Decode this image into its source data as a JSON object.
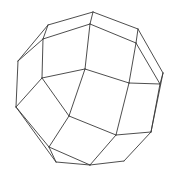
{
  "figure": {
    "type": "wireframe-polyhedron",
    "background": "#ffffff",
    "stroke_color": "#3a3a3a",
    "vertices": {
      "A": [
        48,
        25
      ],
      "B": [
        93,
        12
      ],
      "C": [
        138,
        29
      ],
      "D": [
        43,
        39
      ],
      "E": [
        90,
        24
      ],
      "F": [
        136,
        43
      ],
      "G": [
        18,
        61
      ],
      "H": [
        163,
        73
      ],
      "I": [
        160,
        84
      ],
      "J": [
        42,
        78
      ],
      "K": [
        85,
        69
      ],
      "L": [
        129,
        83
      ],
      "M": [
        16,
        107
      ],
      "N": [
        69,
        116
      ],
      "O": [
        116,
        135
      ],
      "P": [
        151,
        132
      ],
      "Q": [
        49,
        147
      ],
      "R": [
        56,
        162
      ],
      "S": [
        90,
        165
      ],
      "T": [
        124,
        161
      ]
    },
    "edges": [
      [
        "A",
        "B"
      ],
      [
        "B",
        "C"
      ],
      [
        "D",
        "E"
      ],
      [
        "E",
        "F"
      ],
      [
        "B",
        "E"
      ],
      [
        "A",
        "D"
      ],
      [
        "C",
        "F"
      ],
      [
        "A",
        "G"
      ],
      [
        "D",
        "G"
      ],
      [
        "C",
        "H"
      ],
      [
        "F",
        "I"
      ],
      [
        "H",
        "I"
      ],
      [
        "D",
        "J"
      ],
      [
        "E",
        "K"
      ],
      [
        "F",
        "L"
      ],
      [
        "J",
        "K"
      ],
      [
        "K",
        "L"
      ],
      [
        "L",
        "I"
      ],
      [
        "G",
        "M"
      ],
      [
        "J",
        "M"
      ],
      [
        "J",
        "N"
      ],
      [
        "K",
        "N"
      ],
      [
        "L",
        "O"
      ],
      [
        "I",
        "P"
      ],
      [
        "H",
        "P"
      ],
      [
        "N",
        "O"
      ],
      [
        "O",
        "P"
      ],
      [
        "M",
        "Q"
      ],
      [
        "N",
        "Q"
      ],
      [
        "M",
        "R"
      ],
      [
        "Q",
        "R"
      ],
      [
        "Q",
        "S"
      ],
      [
        "R",
        "S"
      ],
      [
        "O",
        "S"
      ],
      [
        "S",
        "T"
      ],
      [
        "P",
        "T"
      ]
    ]
  }
}
